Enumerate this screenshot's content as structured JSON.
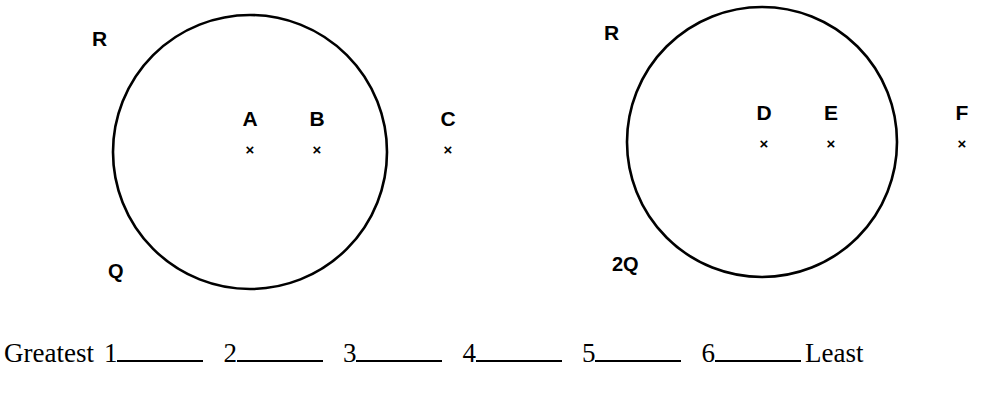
{
  "figure": {
    "type": "physics-ranking-diagram",
    "background_color": "#ffffff",
    "stroke_color": "#000000",
    "spheres": [
      {
        "id": "left",
        "radius_label": "R",
        "charge_label": "Q",
        "center": {
          "x": 250,
          "y": 152
        },
        "radius": 137,
        "points": [
          {
            "label": "A",
            "marker": "×",
            "x": 249,
            "y": 152,
            "inside": true
          },
          {
            "label": "B",
            "marker": "×",
            "x": 316,
            "y": 152,
            "inside": true
          },
          {
            "label": "C",
            "marker": "×",
            "x": 447,
            "y": 152,
            "inside": false
          }
        ]
      },
      {
        "id": "right",
        "radius_label": "R",
        "charge_label": "2Q",
        "center": {
          "x": 762,
          "y": 142
        },
        "radius": 135,
        "points": [
          {
            "label": "D",
            "marker": "×",
            "x": 763,
            "y": 142,
            "inside": true
          },
          {
            "label": "E",
            "marker": "×",
            "x": 830,
            "y": 142,
            "inside": true
          },
          {
            "label": "F",
            "marker": "×",
            "x": 961,
            "y": 142,
            "inside": false
          }
        ]
      }
    ]
  },
  "ranking": {
    "greatest_label": "Greatest",
    "least_label": "Least",
    "slots": [
      "1",
      "2",
      "3",
      "4",
      "5",
      "6"
    ]
  }
}
